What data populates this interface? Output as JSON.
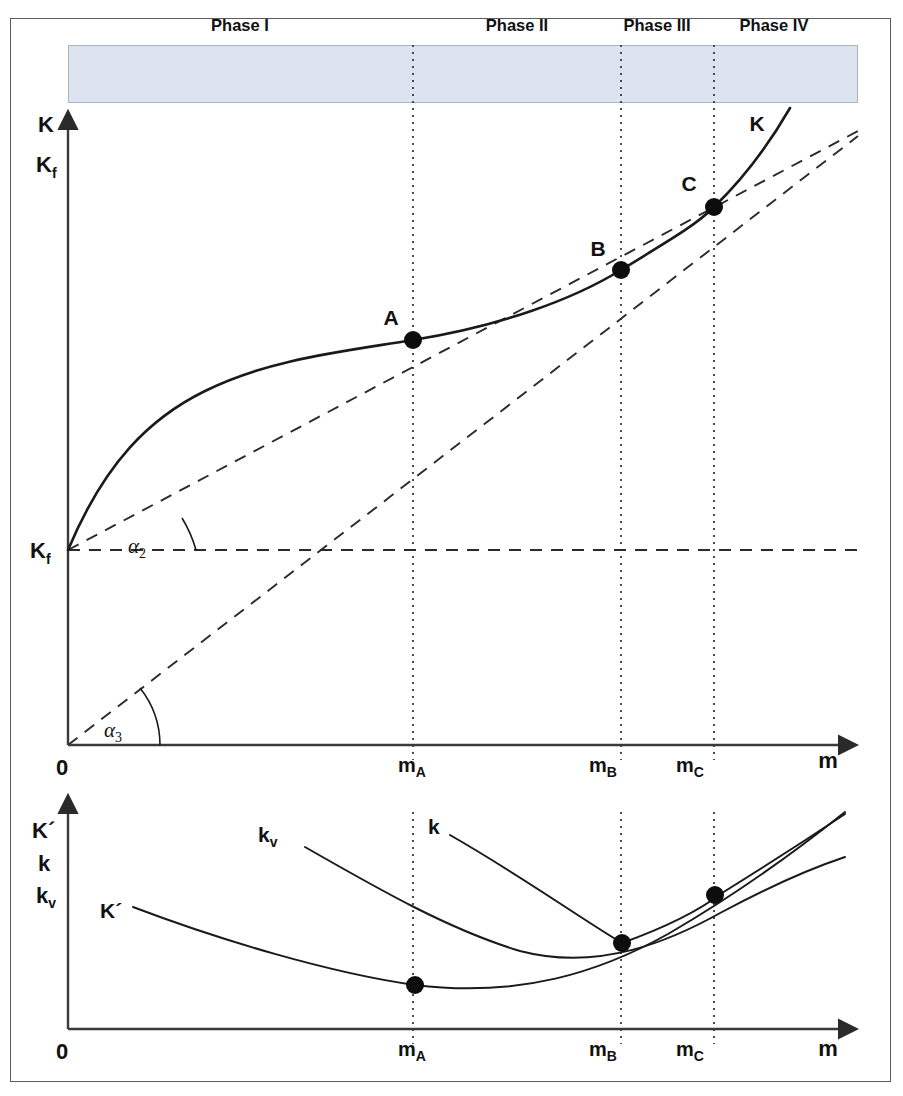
{
  "figure": {
    "background": "#ffffff",
    "frame_color": "#5c5c5c",
    "phase_bar_color": "#dce5ef"
  },
  "phases": [
    {
      "label": "Phase I",
      "x_center": 240
    },
    {
      "label": "Phase II",
      "x_center": 517
    },
    {
      "label": "Phase III",
      "x_center": 657
    },
    {
      "label": "Phase IV",
      "x_center": 774
    }
  ],
  "upper_chart": {
    "y_axis_labels": [
      {
        "text": "K",
        "sub": "",
        "x": 46,
        "y": 132
      },
      {
        "text": "K",
        "sub": "f",
        "x": 40,
        "y": 164
      },
      {
        "text": "K",
        "sub": "f",
        "x": 36,
        "y": 558
      }
    ],
    "x_axis_label": {
      "text": "m",
      "x": 828,
      "y": 768
    },
    "origin_label": {
      "text": "0",
      "x": 62,
      "y": 772
    },
    "tick_labels": [
      {
        "text": "m",
        "sub": "A",
        "x": 402,
        "y": 770
      },
      {
        "text": "m",
        "sub": "B",
        "x": 594,
        "y": 770
      },
      {
        "text": "m",
        "sub": "C",
        "x": 681,
        "y": 770
      }
    ],
    "curve_label": {
      "text": "K",
      "x": 757,
      "y": 131
    },
    "angle_labels": [
      {
        "text": "α",
        "sub": "2",
        "x": 131,
        "y": 553
      },
      {
        "text": "α",
        "sub": "3",
        "x": 107,
        "y": 737
      }
    ],
    "points": [
      {
        "label": "A",
        "cx": 413,
        "cy": 340,
        "label_x": 391,
        "label_y": 325
      },
      {
        "label": "B",
        "cx": 621,
        "cy": 270,
        "label_x": 598,
        "label_y": 256
      },
      {
        "label": "C",
        "cx": 714,
        "cy": 207,
        "label_x": 689,
        "label_y": 191
      }
    ]
  },
  "lower_chart": {
    "y_axis_labels": [
      {
        "text": "K´",
        "sub": "",
        "x": 38,
        "y": 830
      },
      {
        "text": "k",
        "sub": "",
        "x": 44,
        "y": 860
      },
      {
        "text": "k",
        "sub": "v",
        "x": 42,
        "y": 890
      }
    ],
    "x_axis_label": {
      "text": "m",
      "x": 828,
      "y": 1052
    },
    "origin_label": {
      "text": "0",
      "x": 62,
      "y": 1056
    },
    "tick_labels": [
      {
        "text": "m",
        "sub": "A",
        "x": 402,
        "y": 1054
      },
      {
        "text": "m",
        "sub": "B",
        "x": 594,
        "y": 1054
      },
      {
        "text": "m",
        "sub": "C",
        "x": 681,
        "y": 1054
      }
    ],
    "curve_labels": [
      {
        "text": "K´",
        "sub": "",
        "x": 105,
        "y": 912
      },
      {
        "text": "k",
        "sub": "v",
        "x": 265,
        "y": 836
      },
      {
        "text": "k",
        "sub": "",
        "x": 430,
        "y": 828
      }
    ],
    "points": [
      {
        "cx": 415,
        "cy": 985
      },
      {
        "cx": 622,
        "cy": 943
      },
      {
        "cx": 715,
        "cy": 895
      }
    ]
  },
  "chart_data": {
    "type": "line",
    "xlabel": "m",
    "ylabel": "K",
    "grid": false,
    "legend": "none",
    "x_ticks": [
      "0",
      "m_A",
      "m_B",
      "m_C"
    ],
    "x_tick_pixels": [
      68,
      413,
      621,
      714
    ],
    "y_ticks": [
      "K_f"
    ],
    "phases": [
      "Phase I",
      "Phase II",
      "Phase III",
      "Phase IV"
    ],
    "phase_boundaries_x": [
      "m_A",
      "m_B",
      "m_C"
    ],
    "series": [
      {
        "name": "K",
        "kind": "curve",
        "note": "S-shaped total cost curve starting at fixed cost K_f",
        "points": [
          [
            68,
            550
          ],
          [
            413,
            340
          ],
          [
            621,
            270
          ],
          [
            714,
            207
          ],
          [
            790,
            108
          ]
        ]
      },
      {
        "name": "tangent-at-C-from-Kf",
        "kind": "dashed",
        "note": "ray from K_f through inflection/tangency point C",
        "points": [
          [
            68,
            550
          ],
          [
            714,
            207
          ],
          [
            858,
            130
          ]
        ]
      },
      {
        "name": "ray-from-origin-through-B",
        "kind": "dashed",
        "note": "ray from origin 0 tangent to K at B (minimum unit cost)",
        "points": [
          [
            68,
            745
          ],
          [
            621,
            270
          ],
          [
            858,
            136
          ]
        ]
      },
      {
        "name": "K_f-horizontal",
        "kind": "dashed",
        "note": "horizontal fixed cost reference line at K_f",
        "points": [
          [
            68,
            550
          ],
          [
            858,
            550
          ]
        ]
      },
      {
        "name": "K'",
        "kind": "curve",
        "note": "marginal cost curve, minimum at m_A",
        "points": [
          [
            133,
            905
          ],
          [
            415,
            985
          ],
          [
            622,
            943
          ],
          [
            715,
            895
          ],
          [
            845,
            815
          ]
        ]
      },
      {
        "name": "k",
        "kind": "curve",
        "note": "unit total cost curve, minimum at m_B",
        "points": [
          [
            450,
            833
          ],
          [
            622,
            943
          ],
          [
            715,
            895
          ],
          [
            845,
            818
          ]
        ]
      },
      {
        "name": "k_v",
        "kind": "curve",
        "note": "unit variable cost curve, minimum near m_A-m_B",
        "points": [
          [
            305,
            845
          ],
          [
            520,
            950
          ],
          [
            715,
            895
          ],
          [
            845,
            865
          ]
        ]
      }
    ],
    "annotations": [
      {
        "text": "A",
        "x": "m_A",
        "meaning": "inflection of K / minimum of K'"
      },
      {
        "text": "B",
        "x": "m_B",
        "meaning": "tangency of ray from origin / minimum of k"
      },
      {
        "text": "C",
        "x": "m_C",
        "meaning": "tangency of ray from K_f / minimum of k_v"
      },
      {
        "text": "α₂",
        "meaning": "angle of ray from K_f to the m-axis parallel"
      },
      {
        "text": "α₃",
        "meaning": "angle of ray from origin to the m-axis"
      }
    ]
  }
}
